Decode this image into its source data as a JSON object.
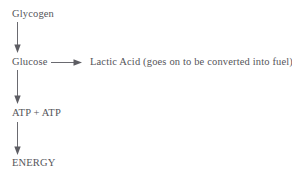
{
  "diagram": {
    "background_color": "#ffffff",
    "text_color": "#55555a",
    "arrow_color": "#6a6a70",
    "nodes": [
      {
        "id": "glycogen",
        "label": "Glycogen"
      },
      {
        "id": "glucose",
        "label": "Glucose"
      },
      {
        "id": "lactic_acid",
        "label": "Lactic Acid (goes on to be converted into fuel)"
      },
      {
        "id": "atp",
        "label": "ATP + ATP"
      },
      {
        "id": "energy",
        "label": "ENERGY"
      }
    ],
    "edges": [
      {
        "id": "edge-glycogen-glucose",
        "from": "glycogen",
        "to": "glucose",
        "direction": "down"
      },
      {
        "id": "edge-glucose-lactic",
        "from": "glucose",
        "to": "lactic_acid",
        "direction": "right"
      },
      {
        "id": "edge-glucose-atp",
        "from": "glucose",
        "to": "atp",
        "direction": "down"
      },
      {
        "id": "edge-atp-energy",
        "from": "atp",
        "to": "energy",
        "direction": "down"
      }
    ]
  }
}
